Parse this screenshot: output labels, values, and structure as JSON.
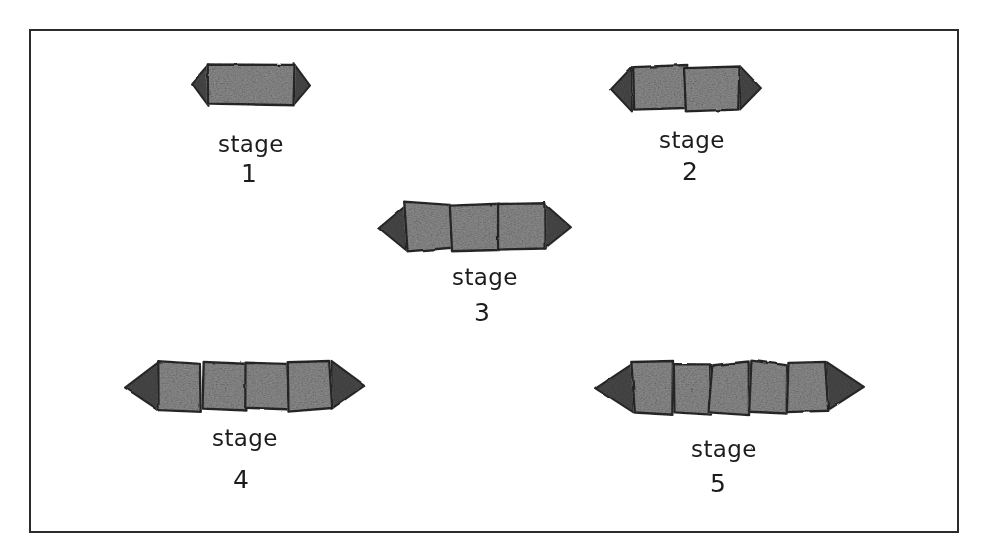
{
  "figure": {
    "medium": "pencil sketch on white paper",
    "background_color": "#ffffff",
    "border_color": "#2b2b2b",
    "ink_color": "#1c1c1c",
    "body_fill_color": "#8c8c8c",
    "body_outline_color": "#2a2a2a",
    "head_tail_fill_color": "#4a4a4a"
  },
  "frame": {
    "x": 30,
    "y": 30,
    "width": 928,
    "height": 502,
    "stroke_width": 2
  },
  "stages": [
    {
      "id": "stage-1",
      "label": "stage",
      "number": "1",
      "segments": 1,
      "body": {
        "cx": 251,
        "cy": 84,
        "length": 118,
        "height": 42
      },
      "label_pos": {
        "x": 251,
        "y": 152
      },
      "number_pos": {
        "x": 249,
        "y": 182
      }
    },
    {
      "id": "stage-2",
      "label": "stage",
      "number": "2",
      "segments": 2,
      "body": {
        "cx": 686,
        "cy": 88,
        "length": 150,
        "height": 44
      },
      "label_pos": {
        "x": 692,
        "y": 148
      },
      "number_pos": {
        "x": 690,
        "y": 180
      }
    },
    {
      "id": "stage-3",
      "label": "stage",
      "number": "3",
      "segments": 3,
      "body": {
        "cx": 475,
        "cy": 227,
        "length": 192,
        "height": 46
      },
      "label_pos": {
        "x": 485,
        "y": 285
      },
      "number_pos": {
        "x": 482,
        "y": 321
      }
    },
    {
      "id": "stage-4",
      "label": "stage",
      "number": "4",
      "segments": 4,
      "body": {
        "cx": 245,
        "cy": 386,
        "length": 240,
        "height": 48
      },
      "label_pos": {
        "x": 245,
        "y": 446
      },
      "number_pos": {
        "x": 241,
        "y": 488
      }
    },
    {
      "id": "stage-5",
      "label": "stage",
      "number": "5",
      "segments": 5,
      "body": {
        "cx": 730,
        "cy": 388,
        "length": 268,
        "height": 50
      },
      "label_pos": {
        "x": 724,
        "y": 457
      },
      "number_pos": {
        "x": 718,
        "y": 492
      }
    }
  ]
}
